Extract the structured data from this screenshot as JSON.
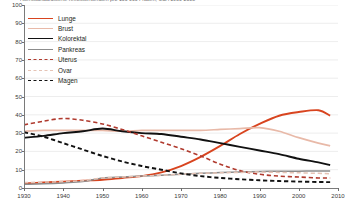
{
  "title": "Altersstandardisierte Krebssterberaten pro 100 000 Frauen, USA 1930-2008",
  "legend": {
    "position": "top-left",
    "items": [
      {
        "label": "Lunge",
        "color": "#d8441f",
        "style": "solid",
        "width": 1.9,
        "key": "lunge"
      },
      {
        "label": "Brust",
        "color": "#e8b9a8",
        "style": "solid",
        "width": 1.7,
        "key": "brust"
      },
      {
        "label": "Kolorektal",
        "color": "#111111",
        "style": "solid",
        "width": 1.9,
        "key": "kolorektal"
      },
      {
        "label": "Pankreas",
        "color": "#8c8c8c",
        "style": "solid",
        "width": 1.5,
        "key": "pankreas"
      },
      {
        "label": "Uterus",
        "color": "#b03a2e",
        "style": "dashed",
        "width": 1.6,
        "key": "uterus"
      },
      {
        "label": "Ovar",
        "color": "#e5c3b5",
        "style": "dashed",
        "width": 1.5,
        "key": "ovar"
      },
      {
        "label": "Magen",
        "color": "#111111",
        "style": "dashed",
        "width": 1.9,
        "key": "magen"
      }
    ]
  },
  "axes": {
    "y_ticks": [
      100,
      90,
      80,
      70,
      60,
      50,
      40,
      30,
      20,
      10,
      0
    ],
    "x_ticks": [
      1930,
      1940,
      1950,
      1960,
      1970,
      1980,
      1990,
      2000,
      2010
    ],
    "xlim": [
      1930,
      2010
    ],
    "ylim": [
      0,
      100
    ],
    "grid": "horizontal-light"
  },
  "chart_data": {
    "type": "line",
    "title": "Altersstandardisierte Krebssterberaten pro 100 000 Frauen, USA 1930-2008",
    "xlabel": "",
    "ylabel": "",
    "xlim": [
      1930,
      2010
    ],
    "ylim": [
      0,
      100
    ],
    "grid": true,
    "legend_position": "top-left",
    "x": [
      1930,
      1935,
      1940,
      1945,
      1950,
      1955,
      1960,
      1965,
      1970,
      1975,
      1980,
      1985,
      1990,
      1995,
      2000,
      2005,
      2008
    ],
    "series": [
      {
        "name": "Lunge",
        "color": "#d8441f",
        "style": "solid",
        "values": [
          2.5,
          3.0,
          3.5,
          4.0,
          4.5,
          5.5,
          6.5,
          8.5,
          12.0,
          17.0,
          23.0,
          29.5,
          35.0,
          39.5,
          41.5,
          42.5,
          39.5
        ]
      },
      {
        "name": "Brust",
        "color": "#e8b9a8",
        "style": "solid",
        "values": [
          31.0,
          31.5,
          31.5,
          31.5,
          31.5,
          31.0,
          31.5,
          31.5,
          31.5,
          31.5,
          32.0,
          32.5,
          33.0,
          31.0,
          27.5,
          24.5,
          23.0
        ]
      },
      {
        "name": "Kolorektal",
        "color": "#111111",
        "style": "solid",
        "values": [
          27.5,
          28.5,
          30.0,
          31.0,
          32.5,
          31.0,
          30.0,
          29.5,
          28.0,
          26.5,
          24.5,
          22.5,
          20.5,
          18.5,
          16.0,
          14.0,
          12.5
        ]
      },
      {
        "name": "Pankreas",
        "color": "#8c8c8c",
        "style": "solid",
        "values": [
          2.0,
          2.3,
          2.8,
          3.5,
          5.5,
          6.0,
          6.5,
          7.0,
          7.5,
          8.0,
          8.5,
          8.8,
          9.0,
          9.2,
          9.2,
          9.3,
          9.3
        ]
      },
      {
        "name": "Uterus",
        "color": "#b03a2e",
        "style": "dashed",
        "values": [
          34.5,
          36.5,
          38.0,
          37.0,
          35.0,
          32.0,
          28.5,
          25.0,
          21.5,
          17.5,
          13.0,
          9.5,
          7.5,
          6.5,
          6.0,
          5.5,
          5.5
        ]
      },
      {
        "name": "Ovar",
        "color": "#e5c3b5",
        "style": "dashed",
        "values": [
          3.0,
          3.2,
          3.5,
          4.0,
          5.5,
          6.0,
          6.5,
          7.0,
          7.5,
          8.0,
          8.3,
          8.5,
          8.7,
          8.5,
          8.3,
          8.0,
          7.8
        ]
      },
      {
        "name": "Magen",
        "color": "#111111",
        "style": "dashed",
        "values": [
          30.5,
          28.0,
          24.5,
          21.0,
          17.5,
          14.5,
          12.0,
          10.0,
          8.0,
          6.5,
          5.5,
          4.8,
          4.2,
          3.8,
          3.5,
          3.3,
          3.2
        ]
      }
    ]
  }
}
